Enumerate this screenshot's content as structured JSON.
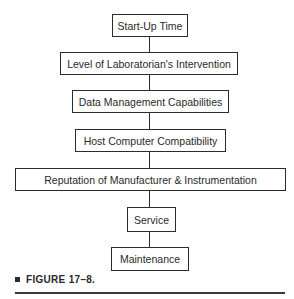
{
  "diagram": {
    "type": "flowchart-vertical",
    "nodes": [
      {
        "id": "n1",
        "label": "Start-Up Time"
      },
      {
        "id": "n2",
        "label": "Level of Laboratorian's Intervention"
      },
      {
        "id": "n3",
        "label": "Data Management Capabilities"
      },
      {
        "id": "n4",
        "label": "Host Computer Compatibility"
      },
      {
        "id": "n5",
        "label": "Reputation of Manufacturer & Instrumentation"
      },
      {
        "id": "n6",
        "label": "Service"
      },
      {
        "id": "n7",
        "label": "Maintenance"
      }
    ],
    "edges": [
      [
        "n1",
        "n2"
      ],
      [
        "n2",
        "n3"
      ],
      [
        "n3",
        "n4"
      ],
      [
        "n4",
        "n5"
      ],
      [
        "n5",
        "n6"
      ],
      [
        "n6",
        "n7"
      ]
    ]
  },
  "caption": {
    "label": "FIGURE 17–8."
  }
}
